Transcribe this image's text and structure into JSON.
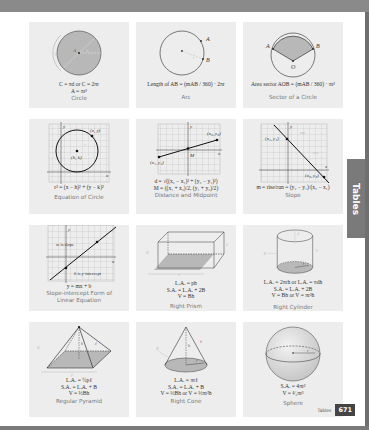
{
  "side_tab": {
    "label": "Tables"
  },
  "footer": {
    "label": "Tables",
    "page_number": "671"
  },
  "cards": [
    {
      "title": "Circle",
      "figure_labels": [
        "C",
        "d",
        "r",
        "A"
      ],
      "formulas": [
        "C = πd or C = 2πr",
        "A = πr²"
      ]
    },
    {
      "title": "Arc",
      "figure_labels": [
        "A",
        "B",
        "r"
      ],
      "formulas": [
        "Length of AB = (mAB / 360) · 2πr"
      ]
    },
    {
      "title": "Sector of a Circle",
      "figure_labels": [
        "A",
        "B",
        "O",
        "r"
      ],
      "formulas": [
        "Area sector AOB = (mAB / 360) · πr²"
      ]
    },
    {
      "title": "Equation of Circle",
      "figure_labels": [
        "y",
        "x",
        "(x, y)",
        "(h, k)",
        "r"
      ],
      "formulas": [
        "r² = (x − h)² + (y − k)²"
      ]
    },
    {
      "title": "Distance and Midpoint",
      "figure_labels": [
        "y",
        "x",
        "(x₁, y₁)",
        "(x₂, y₂)",
        "M"
      ],
      "formulas": [
        "d = √((x₂ − x₁)² + (y₂ − y₁)²)",
        "M = ((x₁ + x₂)/2, (y₁ + y₂)/2)"
      ]
    },
    {
      "title": "Slope",
      "figure_labels": [
        "y",
        "x",
        "(x₁, y₁)",
        "(x₂, y₂)",
        "run",
        "rise"
      ],
      "formulas": [
        "m = rise/run = (y₂ − y₁)/(x₂ − x₁)"
      ]
    },
    {
      "title": "Slope-intercept Form of Linear Equation",
      "title_lines": [
        "Slope-intercept Form of",
        "Linear Equation"
      ],
      "figure_labels": [
        "y",
        "x",
        "m is slope",
        "b is y-intercept"
      ],
      "formulas": [
        "y = mx + b"
      ]
    },
    {
      "title": "Right Prism",
      "figure_labels": [
        "B",
        "h",
        "p"
      ],
      "formulas": [
        "L.A. = ph",
        "S.A. = L.A. + 2B",
        "V = Bh"
      ]
    },
    {
      "title": "Right Cylinder",
      "figure_labels": [
        "B",
        "h",
        "d",
        "r"
      ],
      "formulas": [
        "L.A. = 2πrh or L.A. = πdh",
        "S.A. = L.A. + 2B",
        "V = Bh or V = πr²h"
      ]
    },
    {
      "title": "Regular Pyramid",
      "figure_labels": [
        "B",
        "h",
        "ℓ",
        "p"
      ],
      "formulas": [
        "L.A. = ½pℓ",
        "S.A. = L.A. + B",
        "V = ⅓Bh"
      ]
    },
    {
      "title": "Right Cone",
      "figure_labels": [
        "B",
        "h",
        "ℓ",
        "r"
      ],
      "formulas": [
        "L.A. = πrℓ",
        "S.A. = L.A. + B",
        "V = ⅓Bh or V = ⅓πr²h"
      ]
    },
    {
      "title": "Sphere",
      "figure_labels": [
        "r"
      ],
      "formulas": [
        "S.A. = 4πr²",
        "V = ⁴⁄₃πr³"
      ]
    }
  ]
}
